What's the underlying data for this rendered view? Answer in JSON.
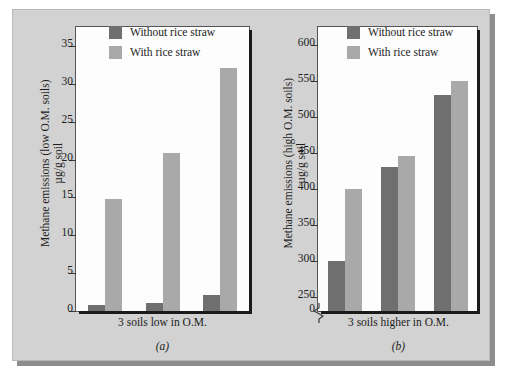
{
  "figure": {
    "background_color": "#d2d2d2",
    "plot_background_color": "#fdfdfd",
    "series_colors": {
      "without_rice_straw": "#6f6f6f",
      "with_rice_straw": "#a9a9a9"
    }
  },
  "legend": {
    "without_label": "Without rice straw",
    "with_label": "With rice straw"
  },
  "panel_a": {
    "tag": "(a)",
    "ylabel_line1": "Methane emissions (low O.M. soils)",
    "ylabel_line2": "µg/g soil",
    "xlabel": "3 soils low in O.M.",
    "yticks": [
      "0",
      "5",
      "10",
      "15",
      "20",
      "25",
      "30",
      "35"
    ]
  },
  "panel_b": {
    "tag": "(b)",
    "ylabel_line1": "Methane emissions (high O.M. soils)",
    "ylabel_line2": "µg/g soil",
    "xlabel": "3 soils higher in O.M.",
    "yticks": [
      "0",
      "250",
      "300",
      "350",
      "400",
      "450",
      "500",
      "550",
      "600"
    ]
  },
  "chart_data": [
    {
      "type": "bar",
      "panel": "(a)",
      "title": "Methane emissions from 3 soils low in organic matter",
      "xlabel": "3 soils low in O.M.",
      "ylabel": "Methane emissions (low O.M. soils) µg/g soil",
      "categories": [
        "Soil 1",
        "Soil 2",
        "Soil 3"
      ],
      "series": [
        {
          "name": "Without rice straw",
          "color": "#6f6f6f",
          "values": [
            0.8,
            1.1,
            2.1
          ]
        },
        {
          "name": "With rice straw",
          "color": "#a9a9a9",
          "values": [
            14.8,
            20.9,
            32.1
          ]
        }
      ],
      "ylim": [
        0,
        37.5
      ],
      "ytick_values": [
        0,
        5,
        10,
        15,
        20,
        25,
        30,
        35
      ],
      "grid": false,
      "axis_break": false,
      "legend_position": "top-left"
    },
    {
      "type": "bar",
      "panel": "(b)",
      "title": "Methane emissions from 3 soils higher in organic matter",
      "xlabel": "3 soils higher in O.M.",
      "ylabel": "Methane emissions (high O.M. soils) µg/g soil",
      "categories": [
        "Soil 1",
        "Soil 2",
        "Soil 3"
      ],
      "series": [
        {
          "name": "Without rice straw",
          "color": "#6f6f6f",
          "values": [
            300,
            430,
            531
          ]
        },
        {
          "name": "With rice straw",
          "color": "#a9a9a9",
          "values": [
            400,
            445,
            550
          ]
        }
      ],
      "ylim": [
        230,
        625
      ],
      "ytick_values": [
        250,
        300,
        350,
        400,
        450,
        500,
        550,
        600
      ],
      "grid": false,
      "axis_break": true,
      "axis_break_between": [
        0,
        250
      ],
      "legend_position": "top-left"
    }
  ]
}
